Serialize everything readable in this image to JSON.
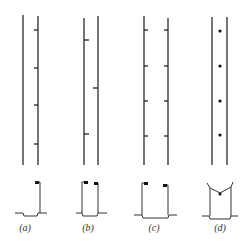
{
  "figure": {
    "panels": [
      {
        "id": "a",
        "label": "(a)",
        "description": "Two vertical lines with short tick marks on right line"
      },
      {
        "id": "b",
        "label": "(b)",
        "description": "Two vertical lines with staggered tick marks alternating sides"
      },
      {
        "id": "c",
        "label": "(c)",
        "description": "Two vertical lines with paired tick marks on both lines"
      },
      {
        "id": "d",
        "label": "(d)",
        "description": "Two vertical lines with dots centered between them"
      }
    ]
  }
}
